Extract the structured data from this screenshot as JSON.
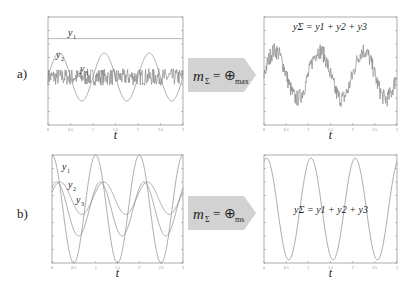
{
  "panels": [
    {
      "label": "a)",
      "operator_text": "m_Σ = ⊕_max",
      "operator_sub": "max"
    },
    {
      "label": "b)",
      "operator_text": "m_Σ = ⊕_ms",
      "operator_sub": "ms"
    }
  ],
  "colors": {
    "line": "#8a8a8a",
    "frame": "#999999",
    "arrow": "#cfcfcf",
    "text": "#222222"
  },
  "chart_data": [
    {
      "id": "a-inputs",
      "type": "line",
      "title": "",
      "xlabel": "t",
      "ylabel": "",
      "xlim": [
        0,
        3
      ],
      "ylim": [
        -2,
        2.5
      ],
      "xticks": [
        "0",
        "0.5",
        "1",
        "1.5",
        "2",
        "2.5",
        "3"
      ],
      "grid": false,
      "series": [
        {
          "name": "y1",
          "kind": "const",
          "value": 1.6
        },
        {
          "name": "y2",
          "kind": "sin",
          "amp": 1.0,
          "freq": 1.0,
          "phase": 0,
          "offset": 0.0
        },
        {
          "name": "y3",
          "kind": "noise",
          "amp": 0.35,
          "offset": 0.0
        }
      ],
      "annotations": [
        "y1",
        "y2",
        "y3"
      ]
    },
    {
      "id": "a-sum",
      "type": "line",
      "title": "y_Σ = y1 + y2 + y3",
      "xlabel": "t",
      "ylabel": "",
      "xlim": [
        0,
        3
      ],
      "ylim": [
        -1.5,
        3
      ],
      "xticks": [
        "0",
        "0.5",
        "1",
        "1.5",
        "2",
        "2.5",
        "3"
      ],
      "grid": false,
      "series": [
        {
          "name": "y_sum",
          "kind": "sin+noise",
          "amp": 1.0,
          "freq": 1.0,
          "phase": 0,
          "offset": 0.6,
          "noise": 0.35
        }
      ]
    },
    {
      "id": "b-inputs",
      "type": "line",
      "title": "",
      "xlabel": "t",
      "ylabel": "",
      "xlim": [
        0,
        3
      ],
      "ylim": [
        -2,
        2
      ],
      "xticks": [
        "0",
        "0.5",
        "1",
        "1.5",
        "2",
        "2.5",
        "3"
      ],
      "grid": false,
      "series": [
        {
          "name": "y1",
          "kind": "sin",
          "amp": 2.0,
          "freq": 1.0,
          "phase": 1.5708,
          "offset": 0.0
        },
        {
          "name": "y2",
          "kind": "sin",
          "amp": 1.0,
          "freq": 1.0,
          "phase": 0.9,
          "offset": 0.0
        },
        {
          "name": "y3",
          "kind": "sin",
          "amp": 0.6,
          "freq": 1.0,
          "phase": 0.4,
          "offset": 0.4
        }
      ],
      "annotations": [
        "y1",
        "y2",
        "y3"
      ]
    },
    {
      "id": "b-sum",
      "type": "line",
      "title": "y_Σ = y1 + y2 + y3",
      "xlabel": "t",
      "ylabel": "",
      "xlim": [
        0,
        3
      ],
      "ylim": [
        -3.5,
        3.5
      ],
      "xticks": [
        "0",
        "0.5",
        "1",
        "1.5",
        "2",
        "2.5",
        "3"
      ],
      "grid": false,
      "series": [
        {
          "name": "y_sum",
          "kind": "sin",
          "amp": 3.3,
          "freq": 1.0,
          "phase": 1.2,
          "offset": 0.0
        }
      ]
    }
  ]
}
